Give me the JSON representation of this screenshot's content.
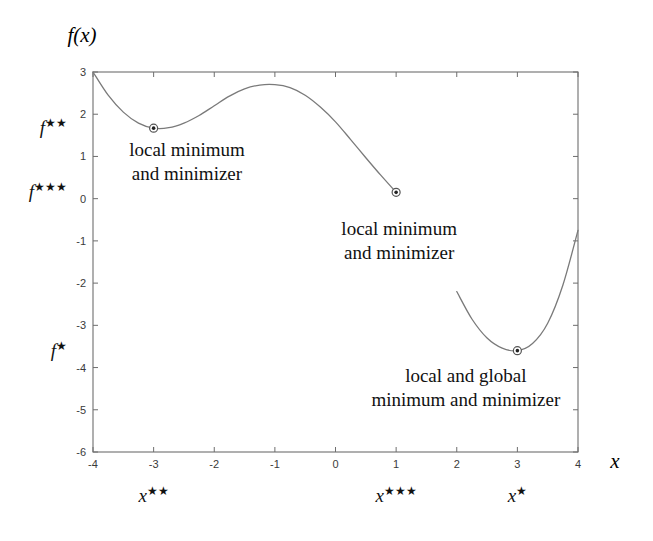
{
  "figure": {
    "axis_labels": {
      "y": "f(x)",
      "x": "x"
    },
    "background_color": "#ffffff",
    "curve_color": "#7a7a7a",
    "frame_color": "#6e6e6e",
    "text_color": "#111111"
  },
  "chart_data": {
    "type": "line",
    "title": "",
    "xlabel": "x",
    "ylabel": "f(x)",
    "xlim": [
      -4,
      4
    ],
    "ylim": [
      -6,
      3
    ],
    "grid": false,
    "legend": "none",
    "xticks": [
      -4,
      -3,
      -2,
      -1,
      0,
      1,
      2,
      3,
      4
    ],
    "xtick_labels": [
      "-4",
      "-3",
      "-2",
      "-1",
      "0",
      "1",
      "2",
      "3",
      "4"
    ],
    "yticks": [
      -6,
      -5,
      -4,
      -3,
      -2,
      -1,
      0,
      1,
      2,
      3
    ],
    "ytick_labels": [
      "-6",
      "-5",
      "-4",
      "-3",
      "-2",
      "-1",
      "0",
      "1",
      "2",
      "3"
    ],
    "series": [
      {
        "name": "branch-1",
        "comment": "continuous branch from x=-4 to x=1, ends at marked point",
        "x": [
          -4,
          -3.75,
          -3.5,
          -3.25,
          -3,
          -2.75,
          -2.5,
          -2.25,
          -2,
          -1.75,
          -1.5,
          -1.25,
          -1,
          -0.75,
          -0.5,
          -0.25,
          0,
          0.25,
          0.5,
          0.75,
          1
        ],
        "y": [
          3,
          2.45,
          2.05,
          1.79,
          1.67,
          1.68,
          1.79,
          1.97,
          2.2,
          2.43,
          2.6,
          2.69,
          2.7,
          2.63,
          2.45,
          2.17,
          1.82,
          1.4,
          0.97,
          0.55,
          0.15
        ]
      },
      {
        "name": "branch-2",
        "comment": "parabolic branch from x=2 to x=4, global minimum near x=3",
        "x": [
          2,
          2.25,
          2.5,
          2.75,
          3,
          3.25,
          3.5,
          3.75,
          4
        ],
        "y": [
          -2.2,
          -2.85,
          -3.3,
          -3.54,
          -3.6,
          -3.43,
          -2.95,
          -2.05,
          -0.75
        ]
      }
    ],
    "marked_points": [
      {
        "name": "local-minimum-left",
        "x": -3,
        "y": 1.67,
        "x_label": "x**",
        "y_label": "f**"
      },
      {
        "name": "local-minimum-middle",
        "x": 1,
        "y": 0.15,
        "x_label": "x***",
        "y_label": "f***"
      },
      {
        "name": "global-minimum-right",
        "x": 3,
        "y": -3.6,
        "x_label": "x*",
        "y_label": "f*"
      }
    ],
    "annotations": [
      {
        "name": "annotation-left",
        "lines": [
          "local minimum",
          "and minimizer"
        ],
        "x": -2.45,
        "y": 1.0
      },
      {
        "name": "annotation-middle",
        "lines": [
          "local minimum",
          "and minimizer"
        ],
        "x": 1.05,
        "y": -0.85
      },
      {
        "name": "annotation-right",
        "lines": [
          "local and global",
          "minimum and minimizer"
        ],
        "x": 2.15,
        "y": -4.35
      }
    ]
  },
  "starred_axis_labels": {
    "y_axis": [
      {
        "name": "f-double-star",
        "base": "f",
        "stars": "★★",
        "value": 1.67
      },
      {
        "name": "f-triple-star",
        "base": "f",
        "stars": "★★★",
        "value": 0.15
      },
      {
        "name": "f-single-star",
        "base": "f",
        "stars": "★",
        "value": -3.6
      }
    ],
    "x_axis": [
      {
        "name": "x-double-star",
        "base": "x",
        "stars": "★★",
        "value": -3
      },
      {
        "name": "x-triple-star",
        "base": "x",
        "stars": "★★★",
        "value": 1
      },
      {
        "name": "x-single-star",
        "base": "x",
        "stars": "★",
        "value": 3
      }
    ]
  }
}
